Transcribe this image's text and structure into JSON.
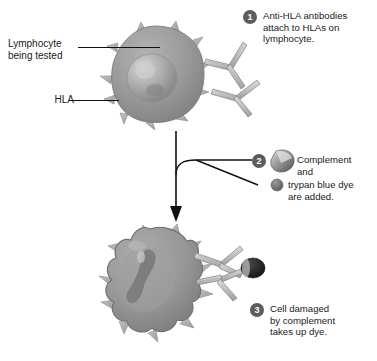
{
  "diagram": {
    "background_color": "#ffffff",
    "palette": {
      "cell_fill": "#8e8e8e",
      "cell_fill_light": "#a3a3a3",
      "nucleus": "#b7b7b7",
      "spike": "#b0b0b0",
      "antibody": "#c6c6c6",
      "antibody_stroke": "#7a7a7a",
      "badge": "#5c5c5c",
      "dye_dot": "#6b6b6b",
      "dye_cap": "#2b2b2b",
      "line": "#111111",
      "text": "#1a1a1a"
    }
  },
  "annotations": {
    "lymphocyte_label": "Lymphocyte\nbeing tested",
    "hla_label": "HLA"
  },
  "steps": [
    {
      "number": "1",
      "text": "Anti-HLA antibodies\nattach to HLAs on\nlymphocyte."
    },
    {
      "number": "2",
      "text_line_1": "Complement",
      "text_line_2": "and",
      "text_line_3": "trypan blue dye",
      "text_line_4": "are added.",
      "icons": {
        "complement": "complement-cone-icon",
        "dye": "trypan-blue-dye-dot-icon"
      }
    },
    {
      "number": "3",
      "text": "Cell damaged\nby complement\ntakes up dye."
    }
  ],
  "figures": {
    "top_cell": "healthy-lymphocyte",
    "bottom_cell": "damaged-lymphocyte",
    "arrow": "downward-process-arrow",
    "antibodies_top": 2,
    "antibodies_bottom": 2
  }
}
